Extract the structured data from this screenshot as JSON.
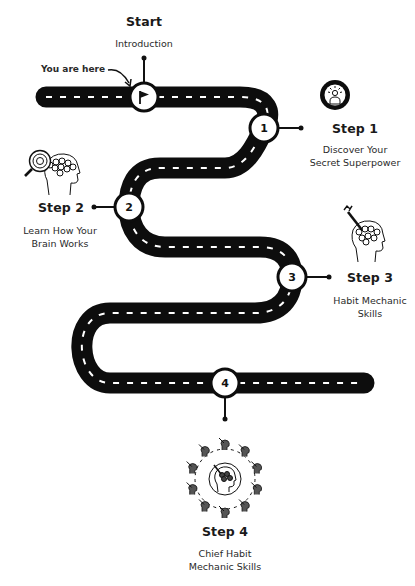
{
  "start": {
    "title": "Start",
    "subtitle": "Introduction",
    "you_are_here": "You are here",
    "icon": "flag-icon"
  },
  "steps": [
    {
      "number": "1",
      "title": "Step 1",
      "line1": "Discover Your",
      "line2": "Secret Superpower",
      "icon": "superpower-person-icon"
    },
    {
      "number": "2",
      "title": "Step 2",
      "line1": "Learn How Your",
      "line2": "Brain Works",
      "icon": "brain-magnifier-icon"
    },
    {
      "number": "3",
      "title": "Step 3",
      "line1": "Habit Mechanic",
      "line2": "Skills",
      "icon": "brain-wrench-icon"
    },
    {
      "number": "4",
      "title": "Step 4",
      "line1": "Chief Habit",
      "line2": "Mechanic Skills",
      "icon": "team-network-icon"
    }
  ],
  "colors": {
    "road": "#0d0d0d",
    "lane_marking": "#ffffff",
    "node_fill": "#ffffff",
    "text": "#1a1a1a"
  }
}
